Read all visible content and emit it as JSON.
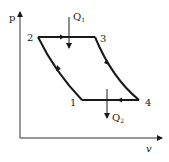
{
  "diagram": {
    "axes": {
      "y_label": "p",
      "x_label": "v"
    },
    "points": [
      {
        "id": "1",
        "label": "1"
      },
      {
        "id": "2",
        "label": "2"
      },
      {
        "id": "3",
        "label": "3"
      },
      {
        "id": "4",
        "label": "4"
      }
    ],
    "heat": {
      "in": {
        "symbol": "Q",
        "subscript": "1"
      },
      "out": {
        "symbol": "Q",
        "subscript": "2"
      }
    },
    "colors": {
      "line": "#1a1a1a",
      "background": "#ffffff"
    }
  }
}
